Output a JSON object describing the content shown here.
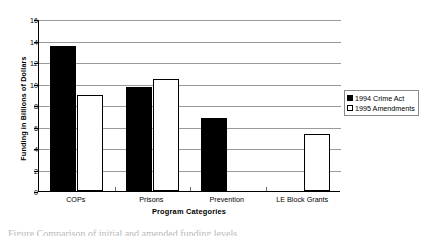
{
  "chart_data": {
    "type": "bar",
    "title": "",
    "xlabel": "Program Categories",
    "ylabel": "Funding in Billions of Dollars",
    "categories": [
      "COPs",
      "Prisons",
      "Prevention",
      "LE Block Grants"
    ],
    "series": [
      {
        "name": "1994 Crime Act",
        "color": "#000000",
        "fill": "solid-black",
        "values": [
          13.5,
          9.7,
          6.8,
          null
        ]
      },
      {
        "name": "1995 Amendments",
        "color": "#ffffff",
        "fill": "white-outline",
        "values": [
          8.9,
          10.4,
          null,
          5.3
        ]
      }
    ],
    "ylim": [
      0,
      16
    ],
    "ytick_values": [
      0,
      2,
      4,
      6,
      8,
      10,
      12,
      14,
      16
    ],
    "ytick_labels": [
      "0",
      "2",
      "4",
      "6",
      "8",
      "10",
      "12",
      "14",
      "16"
    ],
    "grid": "horizontal",
    "legend_position": "right-outside",
    "bar_outline_color": "#000000",
    "gridline_color": "#9a9a9a",
    "axis_color": "#000000",
    "background": "#ffffff"
  },
  "legend": {
    "entries": [
      {
        "label": "1994 Crime Act",
        "swatch": "filled-square-icon"
      },
      {
        "label": "1995 Amendments",
        "swatch": "hollow-square-icon"
      }
    ]
  },
  "caption": {
    "text": "Figure   Comparison of initial and amended funding levels"
  }
}
